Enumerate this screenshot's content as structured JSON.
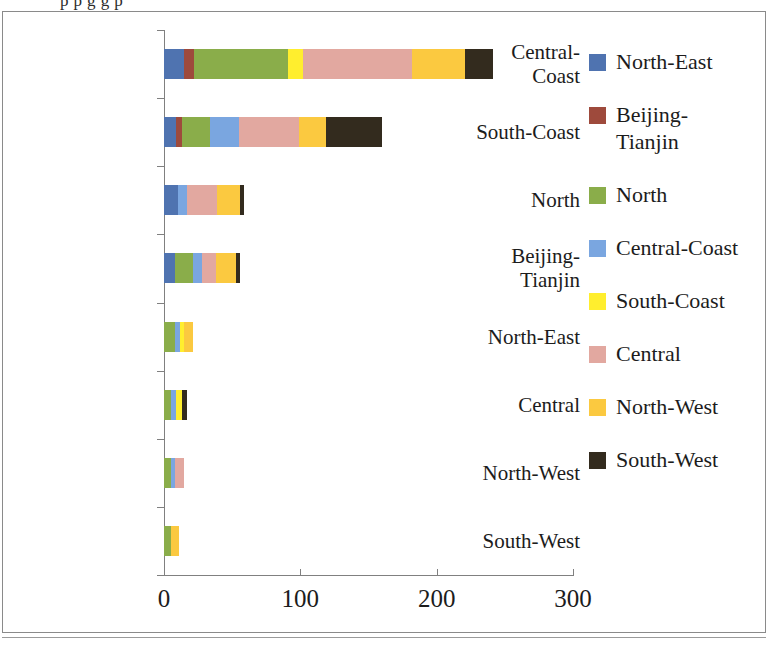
{
  "caption_partial": "p              p g                       g                  p",
  "chart_data": {
    "type": "bar",
    "orientation": "horizontal",
    "stacked": true,
    "title": "",
    "xlabel": "",
    "ylabel": "",
    "xlim": [
      0,
      300
    ],
    "xticks": [
      0,
      100,
      200,
      300
    ],
    "xtick_labels": [
      "0",
      "100",
      "200",
      "300"
    ],
    "grid": false,
    "legend_position": "right",
    "categories": [
      "Central-\nCoast",
      "South-Coast",
      "North",
      "Beijing-\nTianjin",
      "North-East",
      "Central",
      "North-West",
      "South-West"
    ],
    "series": [
      {
        "name": "North-East",
        "color": "#4f73b0",
        "values": [
          15,
          9,
          10,
          8,
          0,
          0,
          0,
          0
        ]
      },
      {
        "name": "Beijing-\nTianjin",
        "color": "#9e4a3c",
        "values": [
          7,
          4,
          0,
          0,
          0,
          0,
          0,
          0
        ]
      },
      {
        "name": "North",
        "color": "#8aad4a",
        "values": [
          69,
          21,
          0,
          13,
          8,
          5,
          5,
          5
        ]
      },
      {
        "name": "Central-Coast",
        "color": "#7aa6e0",
        "values": [
          0,
          21,
          7,
          7,
          4,
          4,
          3,
          0
        ]
      },
      {
        "name": "South-Coast",
        "color": "#ffee2e",
        "values": [
          11,
          0,
          0,
          0,
          3,
          4,
          0,
          0
        ]
      },
      {
        "name": "Central",
        "color": "#e2a8a0",
        "values": [
          80,
          44,
          22,
          10,
          0,
          0,
          7,
          0
        ]
      },
      {
        "name": "North-West",
        "color": "#fbc940",
        "values": [
          39,
          20,
          17,
          15,
          6,
          0,
          0,
          6
        ]
      },
      {
        "name": "South-West",
        "color": "#332b1e",
        "values": [
          20,
          41,
          3,
          3,
          0,
          4,
          0,
          0
        ]
      }
    ],
    "totals": [
      241,
      160,
      59,
      56,
      21,
      17,
      15,
      11
    ]
  }
}
